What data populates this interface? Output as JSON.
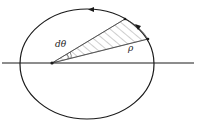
{
  "diagram": {
    "labels": {
      "angle": "dθ",
      "radius": "ρ"
    },
    "colors": {
      "stroke": "#1a1a1a",
      "hatch": "#555555",
      "background": "#ffffff"
    }
  }
}
